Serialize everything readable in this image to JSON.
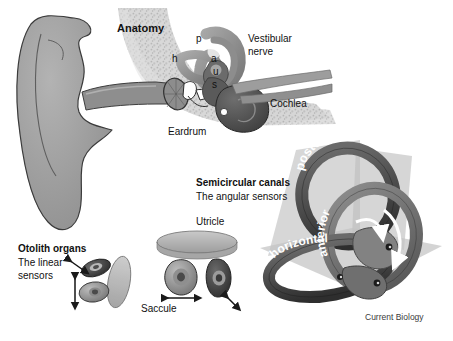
{
  "figure": {
    "credit": "Current Biology",
    "palette": {
      "background": "#ffffff",
      "pinna": "#9a9a9a",
      "pinna_outline": "#3c3c3c",
      "bone_texture": "#cfcfcf",
      "canal_dark": "#4e4e4e",
      "canal_mid": "#6f6f6f",
      "canal_light": "#8c8c8c",
      "cochlea": "#555555",
      "plane_grey": "#c6c6c6",
      "otolith_grey": "#8f8f8f",
      "text": "#111111"
    }
  },
  "panels": {
    "anatomy": {
      "title": "Anatomy",
      "labels": {
        "vestibular_nerve": "Vestibular\nnerve",
        "vestibular_nerve_line1": "Vestibular",
        "vestibular_nerve_line2": "nerve",
        "cochlea": "Cochlea",
        "eardrum": "Eardrum",
        "canal_p": "p",
        "canal_h": "h",
        "canal_a": "a",
        "utricle_u": "u",
        "saccule_s": "s"
      }
    },
    "semicircular_canals": {
      "title": "Semicircular canals",
      "subtitle": "The angular sensors",
      "ring_labels": {
        "posterior": "posterior",
        "anterior": "anterior",
        "horizontal": "horizontal"
      }
    },
    "otolith_organs": {
      "title": "Otolith organs",
      "subtitle_line1": "The linear",
      "subtitle_line2": "sensors",
      "labels": {
        "utricle": "Utricle",
        "saccule": "Saccule"
      }
    }
  }
}
